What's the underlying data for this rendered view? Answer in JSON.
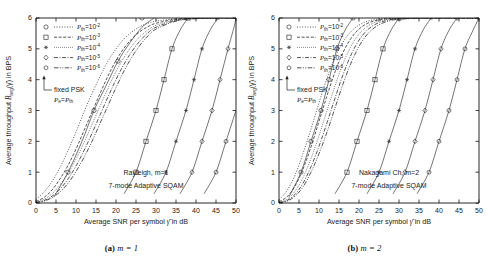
{
  "figure": {
    "panels": [
      {
        "id": "panel-a",
        "caption_label": "(a)",
        "caption_text": "m = 1",
        "annotation_line1": "Rayleigh, m=1",
        "annotation_line2": "7-mode Adaptive SQAM",
        "fixed_label_line1": "fixed PSK",
        "fixed_label_line2": "Pe=Pth"
      },
      {
        "id": "panel-b",
        "caption_label": "(b)",
        "caption_text": "m = 2",
        "annotation_line1": "Nakagami Ch, m=2",
        "annotation_line2": "7-mode Adaptive SQAM",
        "fixed_label_line1": "fixed PSK",
        "fixed_label_line2": "Pe=Pth"
      }
    ],
    "axes": {
      "xlabel_pre": "Average SNR per symbol ",
      "xlabel_sym": "γ",
      "xlabel_post": " in dB",
      "ylabel_pre": "Average throughput ",
      "ylabel_sym": "B",
      "ylabel_sub": "avg",
      "ylabel_arg": "(γ)",
      "ylabel_post": " in BPS",
      "xticks": [
        "0",
        "5",
        "10",
        "15",
        "20",
        "25",
        "30",
        "35",
        "40",
        "45",
        "50"
      ],
      "yticks": [
        "0",
        "1",
        "2",
        "3",
        "4",
        "5",
        "6"
      ]
    },
    "legend": {
      "entries": [
        {
          "marker": "circle",
          "dash": "dotted",
          "base": "Pth=10",
          "exp": "-2"
        },
        {
          "marker": "square",
          "dash": "dashed",
          "base": "Pth=10",
          "exp": "-3"
        },
        {
          "marker": "asterisk",
          "dash": "dotted-fine",
          "base": "Pth=10",
          "exp": "-4"
        },
        {
          "marker": "diamond",
          "dash": "dash-dot",
          "base": "Pth=10",
          "exp": "-5"
        },
        {
          "marker": "hexagon",
          "dash": "dash-dot-dot",
          "base": "Pth=10",
          "exp": "-6"
        }
      ]
    }
  },
  "chart_data": {
    "type": "line",
    "title": "",
    "xlabel": "Average SNR per symbol γ̄ in dB",
    "ylabel": "Average throughput B_avg(γ̄) in BPS",
    "xlim": [
      0,
      50
    ],
    "ylim": [
      0,
      6
    ],
    "xticks": [
      0,
      5,
      10,
      15,
      20,
      25,
      30,
      35,
      40,
      45,
      50
    ],
    "yticks": [
      0,
      1,
      2,
      3,
      4,
      5,
      6
    ],
    "grid": false,
    "legend_position": "upper-left-inside",
    "panels": [
      {
        "name": "(a) m = 1  Rayleigh",
        "series": [
          {
            "name": "Adaptive SQAM Pth=10^-2",
            "style": "dotted",
            "marker": "none",
            "x": [
              0,
              2,
              4,
              6,
              8,
              10,
              12,
              14,
              16,
              18,
              20,
              22,
              24,
              26,
              28,
              30,
              35,
              40,
              45,
              50
            ],
            "y": [
              0.12,
              0.35,
              0.7,
              1.15,
              1.7,
              2.3,
              2.95,
              3.55,
              4.1,
              4.6,
              5.0,
              5.32,
              5.55,
              5.72,
              5.83,
              5.9,
              5.97,
              5.99,
              6.0,
              6.0
            ]
          },
          {
            "name": "Adaptive SQAM Pth=10^-3",
            "style": "dashed",
            "marker": "none",
            "x": [
              0,
              2,
              4,
              6,
              8,
              10,
              12,
              14,
              16,
              18,
              20,
              22,
              24,
              26,
              28,
              30,
              35,
              40,
              45,
              50
            ],
            "y": [
              0.05,
              0.18,
              0.42,
              0.78,
              1.22,
              1.75,
              2.35,
              2.95,
              3.55,
              4.12,
              4.62,
              5.02,
              5.33,
              5.56,
              5.72,
              5.83,
              5.96,
              5.99,
              6.0,
              6.0
            ]
          },
          {
            "name": "Adaptive SQAM Pth=10^-4",
            "style": "dotted-fine",
            "marker": "none",
            "x": [
              0,
              2,
              4,
              6,
              8,
              10,
              12,
              14,
              16,
              18,
              20,
              22,
              24,
              26,
              28,
              30,
              35,
              40,
              45,
              50
            ],
            "y": [
              0.03,
              0.12,
              0.3,
              0.58,
              0.96,
              1.42,
              1.96,
              2.55,
              3.14,
              3.72,
              4.26,
              4.72,
              5.1,
              5.4,
              5.61,
              5.76,
              5.94,
              5.99,
              6.0,
              6.0
            ]
          },
          {
            "name": "Adaptive SQAM Pth=10^-5",
            "style": "dash-dot",
            "marker": "none",
            "x": [
              0,
              2,
              4,
              6,
              8,
              10,
              12,
              14,
              16,
              18,
              20,
              22,
              24,
              26,
              28,
              30,
              35,
              40,
              45,
              50
            ],
            "y": [
              0.02,
              0.08,
              0.22,
              0.45,
              0.78,
              1.2,
              1.7,
              2.26,
              2.85,
              3.44,
              4.0,
              4.5,
              4.92,
              5.26,
              5.52,
              5.7,
              5.92,
              5.98,
              6.0,
              6.0
            ]
          },
          {
            "name": "Adaptive SQAM Pth=10^-6",
            "style": "dash-dot-dot",
            "marker": "none",
            "x": [
              0,
              2,
              4,
              6,
              8,
              10,
              12,
              14,
              16,
              18,
              20,
              22,
              24,
              26,
              28,
              30,
              35,
              40,
              45,
              50
            ],
            "y": [
              0.01,
              0.06,
              0.17,
              0.36,
              0.64,
              1.02,
              1.48,
              2.0,
              2.58,
              3.16,
              3.74,
              4.28,
              4.74,
              5.12,
              5.42,
              5.64,
              5.9,
              5.98,
              6.0,
              6.0
            ]
          },
          {
            "name": "fixed PSK Pth=10^-2",
            "style": "solid",
            "marker": "circle",
            "x": [
              4.5,
              8.0,
              11.5,
              14.5,
              17.5,
              20.5,
              23.5,
              26.5,
              29.5
            ],
            "y": [
              0.2,
              1.0,
              2.0,
              3.0,
              3.8,
              4.6,
              5.2,
              5.7,
              6.0
            ],
            "marker_x": [
              8.0,
              14.5,
              20.5,
              26.5
            ],
            "marker_y": [
              1.0,
              3.0,
              4.6,
              6.0
            ]
          },
          {
            "name": "fixed PSK Pth=10^-3",
            "style": "solid",
            "marker": "square",
            "x": [
              22.0,
              25.0,
              27.5,
              30.0,
              32.0,
              34.0,
              36.0,
              38.0
            ],
            "y": [
              0.3,
              1.0,
              2.0,
              3.0,
              4.0,
              5.0,
              5.6,
              6.0
            ],
            "marker_x": [
              25.0,
              27.5,
              30.0,
              32.0,
              34.0,
              38.0
            ],
            "marker_y": [
              1.0,
              2.0,
              3.0,
              4.0,
              5.0,
              6.0
            ]
          },
          {
            "name": "fixed PSK Pth=10^-4",
            "style": "solid",
            "marker": "asterisk",
            "x": [
              29.5,
              32.5,
              35.0,
              37.5,
              39.5,
              41.5,
              43.5,
              45.5
            ],
            "y": [
              0.3,
              1.0,
              2.0,
              3.0,
              4.0,
              5.0,
              5.6,
              6.0
            ],
            "marker_x": [
              32.5,
              35.0,
              37.5,
              39.5,
              41.5,
              45.5
            ],
            "marker_y": [
              1.0,
              2.0,
              3.0,
              4.0,
              5.0,
              6.0
            ]
          },
          {
            "name": "fixed PSK Pth=10^-5",
            "style": "solid",
            "marker": "diamond",
            "x": [
              36.0,
              39.0,
              41.5,
              44.0,
              46.0,
              48.0,
              49.5,
              50.0
            ],
            "y": [
              0.3,
              1.0,
              2.0,
              3.0,
              4.0,
              5.0,
              5.7,
              6.0
            ],
            "marker_x": [
              39.0,
              41.5,
              44.0,
              46.0,
              48.0
            ],
            "marker_y": [
              1.0,
              2.0,
              3.0,
              4.0,
              5.0
            ]
          },
          {
            "name": "fixed PSK Pth=10^-6",
            "style": "solid",
            "marker": "hexagon",
            "x": [
              42.0,
              45.0,
              47.5,
              50.0
            ],
            "y": [
              0.3,
              1.0,
              2.0,
              3.0
            ],
            "marker_x": [
              45.0,
              47.5
            ],
            "marker_y": [
              1.0,
              2.0
            ]
          }
        ]
      },
      {
        "name": "(b) m = 2  Nakagami",
        "series": [
          {
            "name": "Adaptive SQAM Pth=10^-2",
            "style": "dotted",
            "marker": "none",
            "x": [
              0,
              2,
              4,
              6,
              8,
              10,
              12,
              14,
              16,
              18,
              20,
              22,
              24,
              26,
              28,
              30,
              35,
              40,
              45,
              50
            ],
            "y": [
              0.1,
              0.4,
              0.9,
              1.6,
              2.4,
              3.25,
              4.05,
              4.72,
              5.22,
              5.56,
              5.77,
              5.89,
              5.95,
              5.98,
              5.99,
              6.0,
              6.0,
              6.0,
              6.0,
              6.0
            ]
          },
          {
            "name": "Adaptive SQAM Pth=10^-3",
            "style": "dashed",
            "marker": "none",
            "x": [
              0,
              2,
              4,
              6,
              8,
              10,
              12,
              14,
              16,
              18,
              20,
              22,
              24,
              26,
              28,
              30,
              35,
              40,
              45,
              50
            ],
            "y": [
              0.04,
              0.2,
              0.55,
              1.1,
              1.82,
              2.65,
              3.48,
              4.25,
              4.88,
              5.34,
              5.64,
              5.82,
              5.91,
              5.96,
              5.98,
              5.99,
              6.0,
              6.0,
              6.0,
              6.0
            ]
          },
          {
            "name": "Adaptive SQAM Pth=10^-4",
            "style": "dotted-fine",
            "marker": "none",
            "x": [
              0,
              2,
              4,
              6,
              8,
              10,
              12,
              14,
              16,
              18,
              20,
              22,
              24,
              26,
              28,
              30,
              35,
              40,
              45,
              50
            ],
            "y": [
              0.02,
              0.12,
              0.38,
              0.82,
              1.44,
              2.18,
              3.0,
              3.8,
              4.52,
              5.08,
              5.48,
              5.72,
              5.86,
              5.93,
              5.97,
              5.98,
              6.0,
              6.0,
              6.0,
              6.0
            ]
          },
          {
            "name": "Adaptive SQAM Pth=10^-5",
            "style": "dash-dot",
            "marker": "none",
            "x": [
              0,
              2,
              4,
              6,
              8,
              10,
              12,
              14,
              16,
              18,
              20,
              22,
              24,
              26,
              28,
              30,
              35,
              40,
              45,
              50
            ],
            "y": [
              0.01,
              0.08,
              0.28,
              0.64,
              1.18,
              1.84,
              2.6,
              3.4,
              4.16,
              4.8,
              5.28,
              5.6,
              5.79,
              5.89,
              5.95,
              5.97,
              6.0,
              6.0,
              6.0,
              6.0
            ]
          },
          {
            "name": "Adaptive SQAM Pth=10^-6",
            "style": "dash-dot-dot",
            "marker": "none",
            "x": [
              0,
              2,
              4,
              6,
              8,
              10,
              12,
              14,
              16,
              18,
              20,
              22,
              24,
              26,
              28,
              30,
              35,
              40,
              45,
              50
            ],
            "y": [
              0.01,
              0.06,
              0.22,
              0.52,
              1.0,
              1.6,
              2.3,
              3.08,
              3.86,
              4.54,
              5.08,
              5.46,
              5.7,
              5.84,
              5.92,
              5.96,
              5.99,
              6.0,
              6.0,
              6.0
            ]
          },
          {
            "name": "fixed PSK Pth=10^-2",
            "style": "solid",
            "marker": "circle",
            "x": [
              2.5,
              5.5,
              8.0,
              10.5,
              12.5,
              14.5,
              16.5,
              18.5
            ],
            "y": [
              0.2,
              1.0,
              2.0,
              3.0,
              4.0,
              5.0,
              5.6,
              6.0
            ],
            "marker_x": [
              5.5,
              8.0,
              10.5,
              12.5,
              14.5,
              18.5
            ],
            "marker_y": [
              1.0,
              2.0,
              3.0,
              4.0,
              5.0,
              6.0
            ]
          },
          {
            "name": "fixed PSK Pth=10^-3",
            "style": "solid",
            "marker": "square",
            "x": [
              14.0,
              17.0,
              19.5,
              22.0,
              24.0,
              26.0,
              28.0,
              30.0
            ],
            "y": [
              0.3,
              1.0,
              2.0,
              3.0,
              4.0,
              5.0,
              5.6,
              6.0
            ],
            "marker_x": [
              17.0,
              19.5,
              22.0,
              24.0,
              26.0,
              30.0
            ],
            "marker_y": [
              1.0,
              2.0,
              3.0,
              4.0,
              5.0,
              6.0
            ]
          },
          {
            "name": "fixed PSK Pth=10^-4",
            "style": "solid",
            "marker": "asterisk",
            "x": [
              22.0,
              25.0,
              27.5,
              30.0,
              32.0,
              34.0,
              36.0,
              38.0
            ],
            "y": [
              0.3,
              1.0,
              2.0,
              3.0,
              4.0,
              5.0,
              5.6,
              6.0
            ],
            "marker_x": [
              25.0,
              27.5,
              30.0,
              32.0,
              34.0,
              38.0
            ],
            "marker_y": [
              1.0,
              2.0,
              3.0,
              4.0,
              5.0,
              6.0
            ]
          },
          {
            "name": "fixed PSK Pth=10^-5",
            "style": "solid",
            "marker": "diamond",
            "x": [
              28.5,
              31.5,
              34.0,
              36.5,
              38.5,
              40.5,
              42.5,
              44.5
            ],
            "y": [
              0.3,
              1.0,
              2.0,
              3.0,
              4.0,
              5.0,
              5.6,
              6.0
            ],
            "marker_x": [
              31.5,
              34.0,
              36.5,
              38.5,
              40.5,
              44.5
            ],
            "marker_y": [
              1.0,
              2.0,
              3.0,
              4.0,
              5.0,
              6.0
            ]
          },
          {
            "name": "fixed PSK Pth=10^-6",
            "style": "solid",
            "marker": "hexagon",
            "x": [
              34.5,
              37.5,
              40.0,
              42.5,
              44.5,
              46.5,
              48.5,
              50.0
            ],
            "y": [
              0.3,
              1.0,
              2.0,
              3.0,
              4.0,
              5.0,
              5.6,
              6.0
            ],
            "marker_x": [
              37.5,
              40.0,
              42.5,
              44.5,
              46.5,
              50.0
            ],
            "marker_y": [
              1.0,
              2.0,
              3.0,
              4.0,
              5.0,
              6.0
            ]
          }
        ]
      }
    ]
  }
}
